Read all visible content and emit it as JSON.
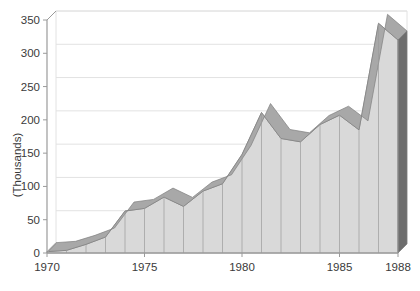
{
  "chart_data": {
    "type": "area",
    "title": "",
    "subtitle": "",
    "xlabel": "",
    "ylabel": "(Thousands)",
    "x": [
      1970,
      1971,
      1972,
      1973,
      1974,
      1975,
      1976,
      1977,
      1978,
      1979,
      1980,
      1981,
      1982,
      1983,
      1984,
      1985,
      1986,
      1987,
      1988
    ],
    "categories": [
      "1970",
      "1971",
      "1972",
      "1973",
      "1974",
      "1975",
      "1976",
      "1977",
      "1978",
      "1979",
      "1980",
      "1981",
      "1982",
      "1983",
      "1984",
      "1985",
      "1986",
      "1987",
      "1988"
    ],
    "values": [
      2,
      4,
      13,
      24,
      63,
      67,
      84,
      70,
      93,
      104,
      148,
      211,
      172,
      167,
      193,
      207,
      185,
      345,
      320
    ],
    "series": [
      {
        "name": "Series 1",
        "values": [
          2,
          4,
          13,
          24,
          63,
          67,
          84,
          70,
          93,
          104,
          148,
          211,
          172,
          167,
          193,
          207,
          185,
          345,
          320
        ]
      }
    ],
    "xlim": [
      1970,
      1988
    ],
    "ylim": [
      0,
      350
    ],
    "ytick_values": [
      0,
      50,
      100,
      150,
      200,
      250,
      300,
      350
    ],
    "ytick_labels": [
      "0",
      "50",
      "100",
      "150",
      "200",
      "250",
      "300",
      "350"
    ],
    "xtick_values": [
      1970,
      1975,
      1980,
      1985,
      1988
    ],
    "xtick_labels": [
      "1970",
      "1975",
      "1980",
      "1985",
      "1988"
    ],
    "grid": true,
    "grid_axis": "y",
    "legend": false,
    "legend_position": "none",
    "style": "3d-area",
    "colors": {
      "area_face": "#d9d9d9",
      "area_top": "#a8a8a8",
      "area_side": "#6e6e6e",
      "outline": "#808080",
      "gridline": "#e2e2e2",
      "axis": "#9a9a9a",
      "text": "#3a3a3a",
      "background": "#ffffff"
    }
  },
  "axes": {
    "y_title": "(Thousands)",
    "y_ticks": [
      "350",
      "300",
      "250",
      "200",
      "150",
      "100",
      "50",
      "0"
    ],
    "x_ticks": [
      "1970",
      "1975",
      "1980",
      "1985",
      "1988"
    ]
  }
}
